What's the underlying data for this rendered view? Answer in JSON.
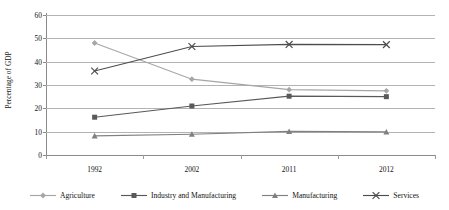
{
  "chart_data": {
    "type": "line",
    "title": "",
    "xlabel": "",
    "ylabel": "Percentage of GDP",
    "categories": [
      "1992",
      "2002",
      "2011",
      "2012"
    ],
    "ylim": [
      0,
      60
    ],
    "ytick_labels": [
      "0",
      "10",
      "20",
      "30",
      "40",
      "50",
      "60"
    ],
    "ytick_values": [
      0,
      10,
      20,
      30,
      40,
      50,
      60
    ],
    "grid": true,
    "legend_position": "bottom",
    "series": [
      {
        "name": "Agriculture",
        "marker": "diamond",
        "color": "#a6a6a6",
        "values": [
          48.0,
          32.5,
          28.0,
          27.5
        ]
      },
      {
        "name": "Industry and Manufacturing",
        "marker": "square",
        "color": "#595959",
        "values": [
          16.2,
          21.0,
          25.2,
          25.0
        ]
      },
      {
        "name": "Manufacturing",
        "marker": "triangle",
        "color": "#808080",
        "values": [
          8.2,
          8.9,
          10.1,
          9.9
        ]
      },
      {
        "name": "Services",
        "marker": "cross",
        "color": "#4d4d4d",
        "values": [
          36.0,
          46.5,
          47.4,
          47.3
        ]
      }
    ]
  }
}
